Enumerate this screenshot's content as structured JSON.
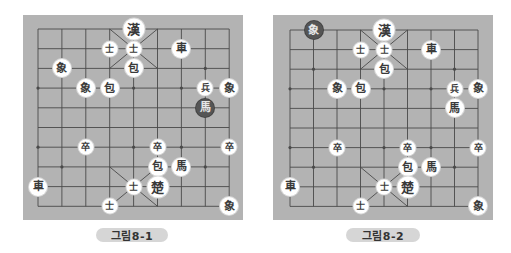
{
  "colors": {
    "board_bg": "#b3b3b3",
    "grid_line": "#4a4a4a",
    "piece_light": "#ffffff",
    "piece_dark": "#555555",
    "caption_bg": "#d6d6d6"
  },
  "boards": [
    {
      "caption": "그림8-1",
      "pieces": [
        {
          "label": "漢",
          "col": 4,
          "row": 0,
          "size": "large",
          "dark": false
        },
        {
          "label": "士",
          "col": 3,
          "row": 1,
          "size": "small",
          "dark": false
        },
        {
          "label": "士",
          "col": 4,
          "row": 1,
          "size": "small",
          "dark": false
        },
        {
          "label": "車",
          "col": 6,
          "row": 1,
          "size": "normal",
          "dark": false
        },
        {
          "label": "象",
          "col": 1,
          "row": 2,
          "size": "normal",
          "dark": false
        },
        {
          "label": "包",
          "col": 4,
          "row": 2,
          "size": "normal",
          "dark": false
        },
        {
          "label": "象",
          "col": 2,
          "row": 3,
          "size": "normal",
          "dark": false
        },
        {
          "label": "包",
          "col": 3,
          "row": 3,
          "size": "normal",
          "dark": false
        },
        {
          "label": "兵",
          "col": 7,
          "row": 3,
          "size": "small",
          "dark": false
        },
        {
          "label": "象",
          "col": 8,
          "row": 3,
          "size": "normal",
          "dark": false
        },
        {
          "label": "馬",
          "col": 7,
          "row": 4,
          "size": "normal",
          "dark": true
        },
        {
          "label": "卒",
          "col": 2,
          "row": 6,
          "size": "small",
          "dark": false
        },
        {
          "label": "卒",
          "col": 5,
          "row": 6,
          "size": "small",
          "dark": false
        },
        {
          "label": "卒",
          "col": 8,
          "row": 6,
          "size": "small",
          "dark": false
        },
        {
          "label": "包",
          "col": 5,
          "row": 7,
          "size": "normal",
          "dark": false
        },
        {
          "label": "馬",
          "col": 6,
          "row": 7,
          "size": "normal",
          "dark": false
        },
        {
          "label": "車",
          "col": 0,
          "row": 8,
          "size": "normal",
          "dark": false
        },
        {
          "label": "士",
          "col": 4,
          "row": 8,
          "size": "small",
          "dark": false
        },
        {
          "label": "楚",
          "col": 5,
          "row": 8,
          "size": "large",
          "dark": false
        },
        {
          "label": "士",
          "col": 3,
          "row": 9,
          "size": "small",
          "dark": false
        },
        {
          "label": "象",
          "col": 8,
          "row": 9,
          "size": "normal",
          "dark": false
        }
      ]
    },
    {
      "caption": "그림8-2",
      "pieces": [
        {
          "label": "象",
          "col": 1,
          "row": 0,
          "size": "normal",
          "dark": true
        },
        {
          "label": "漢",
          "col": 4,
          "row": 0,
          "size": "large",
          "dark": false
        },
        {
          "label": "士",
          "col": 3,
          "row": 1,
          "size": "small",
          "dark": false
        },
        {
          "label": "士",
          "col": 4,
          "row": 1,
          "size": "small",
          "dark": false
        },
        {
          "label": "車",
          "col": 6,
          "row": 1,
          "size": "normal",
          "dark": false
        },
        {
          "label": "包",
          "col": 4,
          "row": 2,
          "size": "normal",
          "dark": false
        },
        {
          "label": "象",
          "col": 2,
          "row": 3,
          "size": "normal",
          "dark": false
        },
        {
          "label": "包",
          "col": 3,
          "row": 3,
          "size": "normal",
          "dark": false
        },
        {
          "label": "兵",
          "col": 7,
          "row": 3,
          "size": "small",
          "dark": false
        },
        {
          "label": "象",
          "col": 8,
          "row": 3,
          "size": "normal",
          "dark": false
        },
        {
          "label": "馬",
          "col": 7,
          "row": 4,
          "size": "normal",
          "dark": false
        },
        {
          "label": "卒",
          "col": 2,
          "row": 6,
          "size": "small",
          "dark": false
        },
        {
          "label": "卒",
          "col": 5,
          "row": 6,
          "size": "small",
          "dark": false
        },
        {
          "label": "卒",
          "col": 8,
          "row": 6,
          "size": "small",
          "dark": false
        },
        {
          "label": "包",
          "col": 5,
          "row": 7,
          "size": "normal",
          "dark": false
        },
        {
          "label": "馬",
          "col": 6,
          "row": 7,
          "size": "normal",
          "dark": false
        },
        {
          "label": "車",
          "col": 0,
          "row": 8,
          "size": "normal",
          "dark": false
        },
        {
          "label": "士",
          "col": 4,
          "row": 8,
          "size": "small",
          "dark": false
        },
        {
          "label": "楚",
          "col": 5,
          "row": 8,
          "size": "large",
          "dark": false
        },
        {
          "label": "士",
          "col": 3,
          "row": 9,
          "size": "small",
          "dark": false
        },
        {
          "label": "象",
          "col": 8,
          "row": 9,
          "size": "normal",
          "dark": false
        }
      ]
    }
  ]
}
